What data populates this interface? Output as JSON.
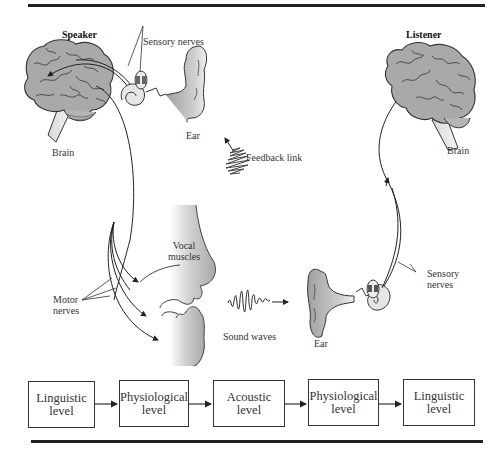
{
  "figure": {
    "roles": {
      "speaker": "Speaker",
      "listener": "Listener"
    },
    "labels": {
      "speaker_brain": "Brain",
      "speaker_sensory_nerves": "Sensory nerves",
      "speaker_ear": "Ear",
      "feedback_link": "Feedback link",
      "vocal_muscles_line1": "Vocal",
      "vocal_muscles_line2": "muscles",
      "motor_nerves_line1": "Motor",
      "motor_nerves_line2": "nerves",
      "sound_waves": "Sound waves",
      "listener_ear": "Ear",
      "listener_sensory_nerves_line1": "Sensory",
      "listener_sensory_nerves_line2": "nerves",
      "listener_brain": "Brain"
    },
    "levels": [
      {
        "line1": "Linguistic",
        "line2": "level"
      },
      {
        "line1": "Physiological",
        "line2": "level"
      },
      {
        "line1": "Acoustic",
        "line2": "level"
      },
      {
        "line1": "Physiological",
        "line2": "level"
      },
      {
        "line1": "Linguistic",
        "line2": "level"
      }
    ],
    "colors": {
      "organ_fill": "#a9a9a9",
      "line": "#222222",
      "background": "#ffffff"
    }
  }
}
